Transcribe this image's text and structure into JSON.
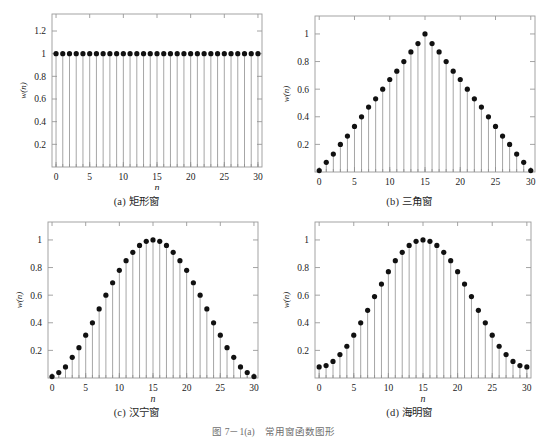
{
  "figure": {
    "caption": "图 7－1(a)　常用窗函数图形",
    "background": "#ffffff",
    "marker_color": "#111111",
    "stem_color": "#8f8f8f",
    "axis_color": "#9a9a9a"
  },
  "panels": [
    {
      "id": "a",
      "caption": "(a) 矩形窗",
      "name": "rectangular-window",
      "xlabel": "n",
      "ylabel": "w(n)",
      "xticks": [
        0,
        5,
        10,
        15,
        20,
        25,
        30
      ],
      "xticklabels": [
        "0",
        "5",
        "10",
        "15",
        "20",
        "25",
        "30"
      ],
      "yticks": [
        0.2,
        0.4,
        0.6,
        0.8,
        1,
        1.2
      ],
      "yticklabels": [
        "0.2",
        "0.4",
        "0.6",
        "0.8",
        "1",
        "1.2"
      ],
      "xlim": [
        -0.6,
        30.6
      ],
      "ylim": [
        0,
        1.35
      ],
      "chart_data": {
        "type": "stem",
        "title": "(a) 矩形窗",
        "xlabel": "n",
        "ylabel": "w(n)",
        "x": [
          0,
          1,
          2,
          3,
          4,
          5,
          6,
          7,
          8,
          9,
          10,
          11,
          12,
          13,
          14,
          15,
          16,
          17,
          18,
          19,
          20,
          21,
          22,
          23,
          24,
          25,
          26,
          27,
          28,
          29,
          30
        ],
        "values": [
          1,
          1,
          1,
          1,
          1,
          1,
          1,
          1,
          1,
          1,
          1,
          1,
          1,
          1,
          1,
          1,
          1,
          1,
          1,
          1,
          1,
          1,
          1,
          1,
          1,
          1,
          1,
          1,
          1,
          1,
          1
        ],
        "xlim": [
          -0.6,
          30.6
        ],
        "ylim": [
          0,
          1.35
        ],
        "grid": false,
        "legend": "none"
      }
    },
    {
      "id": "b",
      "caption": "(b) 三角窗",
      "name": "triangular-window",
      "xlabel": "n",
      "ylabel": "w(n)",
      "xticks": [
        0,
        5,
        10,
        15,
        20,
        25,
        30
      ],
      "xticklabels": [
        "0",
        "5",
        "10",
        "15",
        "20",
        "25",
        "30"
      ],
      "yticks": [
        0.2,
        0.4,
        0.6,
        0.8,
        1
      ],
      "yticklabels": [
        "0.2",
        "0.4",
        "0.6",
        "0.8",
        "1"
      ],
      "xlim": [
        -0.6,
        30.6
      ],
      "ylim": [
        0,
        1.13
      ],
      "chart_data": {
        "type": "stem",
        "title": "(b) 三角窗",
        "xlabel": "n",
        "ylabel": "w(n)",
        "x": [
          0,
          1,
          2,
          3,
          4,
          5,
          6,
          7,
          8,
          9,
          10,
          11,
          12,
          13,
          14,
          15,
          16,
          17,
          18,
          19,
          20,
          21,
          22,
          23,
          24,
          25,
          26,
          27,
          28,
          29,
          30
        ],
        "values": [
          0.01,
          0.07,
          0.13,
          0.2,
          0.26,
          0.33,
          0.4,
          0.47,
          0.53,
          0.6,
          0.67,
          0.73,
          0.8,
          0.87,
          0.93,
          1.0,
          0.93,
          0.87,
          0.8,
          0.73,
          0.67,
          0.6,
          0.53,
          0.47,
          0.4,
          0.33,
          0.26,
          0.2,
          0.13,
          0.07,
          0.01
        ],
        "xlim": [
          -0.6,
          30.6
        ],
        "ylim": [
          0,
          1.13
        ],
        "grid": false,
        "legend": "none"
      }
    },
    {
      "id": "c",
      "caption": "(c) 汉宁窗",
      "name": "hanning-window",
      "xlabel": "n",
      "ylabel": "w(n)",
      "xticks": [
        0,
        5,
        10,
        15,
        20,
        25,
        30
      ],
      "xticklabels": [
        "0",
        "5",
        "10",
        "15",
        "20",
        "25",
        "30"
      ],
      "yticks": [
        0.2,
        0.4,
        0.6,
        0.8,
        1
      ],
      "yticklabels": [
        "0.2",
        "0.4",
        "0.6",
        "0.8",
        "1"
      ],
      "xlim": [
        -0.6,
        30.6
      ],
      "ylim": [
        0,
        1.13
      ],
      "chart_data": {
        "type": "stem",
        "title": "(c) 汉宁窗",
        "xlabel": "n",
        "ylabel": "w(n)",
        "x": [
          0,
          1,
          2,
          3,
          4,
          5,
          6,
          7,
          8,
          9,
          10,
          11,
          12,
          13,
          14,
          15,
          16,
          17,
          18,
          19,
          20,
          21,
          22,
          23,
          24,
          25,
          26,
          27,
          28,
          29,
          30
        ],
        "values": [
          0.01,
          0.04,
          0.08,
          0.15,
          0.22,
          0.31,
          0.4,
          0.5,
          0.6,
          0.69,
          0.78,
          0.85,
          0.91,
          0.96,
          0.99,
          1.0,
          0.99,
          0.96,
          0.91,
          0.85,
          0.78,
          0.69,
          0.6,
          0.5,
          0.4,
          0.31,
          0.22,
          0.15,
          0.08,
          0.04,
          0.01
        ],
        "xlim": [
          -0.6,
          30.6
        ],
        "ylim": [
          0,
          1.13
        ],
        "grid": false,
        "legend": "none"
      }
    },
    {
      "id": "d",
      "caption": "(d) 海明窗",
      "name": "hamming-window",
      "xlabel": "n",
      "ylabel": "w(n)",
      "xticks": [
        0,
        5,
        10,
        15,
        20,
        25,
        30
      ],
      "xticklabels": [
        "0",
        "5",
        "10",
        "15",
        "20",
        "25",
        "30"
      ],
      "yticks": [
        0.2,
        0.4,
        0.6,
        0.8,
        1
      ],
      "yticklabels": [
        "0.2",
        "0.4",
        "0.6",
        "0.8",
        "1"
      ],
      "xlim": [
        -0.6,
        30.6
      ],
      "ylim": [
        0,
        1.13
      ],
      "chart_data": {
        "type": "stem",
        "title": "(d) 海明窗",
        "xlabel": "n",
        "ylabel": "w(n)",
        "x": [
          0,
          1,
          2,
          3,
          4,
          5,
          6,
          7,
          8,
          9,
          10,
          11,
          12,
          13,
          14,
          15,
          16,
          17,
          18,
          19,
          20,
          21,
          22,
          23,
          24,
          25,
          26,
          27,
          28,
          29,
          30
        ],
        "values": [
          0.08,
          0.09,
          0.12,
          0.17,
          0.23,
          0.31,
          0.4,
          0.49,
          0.59,
          0.68,
          0.77,
          0.85,
          0.91,
          0.96,
          0.99,
          1.0,
          0.99,
          0.96,
          0.91,
          0.85,
          0.77,
          0.68,
          0.59,
          0.49,
          0.4,
          0.31,
          0.23,
          0.17,
          0.12,
          0.09,
          0.08
        ],
        "xlim": [
          -0.6,
          30.6
        ],
        "ylim": [
          0,
          1.13
        ],
        "grid": false,
        "legend": "none"
      }
    }
  ]
}
